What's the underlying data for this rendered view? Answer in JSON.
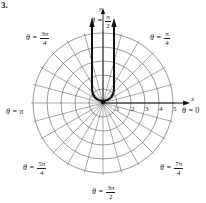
{
  "problem_number": "3.",
  "axes": {
    "x_label": "x",
    "y_label": "y"
  },
  "radial_ticks": [
    "1",
    "2",
    "3",
    "4",
    "5"
  ],
  "angle_labels": {
    "theta0": {
      "prefix": "θ = ",
      "text": "0"
    },
    "pi4": {
      "prefix": "θ = ",
      "num": "π",
      "den": "4"
    },
    "pi2": {
      "prefix": "θ = ",
      "num": "π",
      "den": "2"
    },
    "threepi4": {
      "prefix": "θ = ",
      "num": "3π",
      "den": "4"
    },
    "pi": {
      "prefix": "θ = ",
      "text": "π"
    },
    "fivepi4": {
      "prefix": "θ = ",
      "num": "5π",
      "den": "4"
    },
    "threepi2": {
      "prefix": "θ = ",
      "num": "3π",
      "den": "2"
    },
    "sevenpi4": {
      "prefix": "θ = ",
      "num": "7π",
      "den": "4"
    }
  },
  "grid": {
    "rings": 5,
    "spokes": 24,
    "center": [
      103,
      103
    ],
    "ring_spacing_px": 14
  },
  "curve": {
    "description": "U-shaped polar curve opening upward with two arrows pointing up",
    "color": "#111111"
  }
}
